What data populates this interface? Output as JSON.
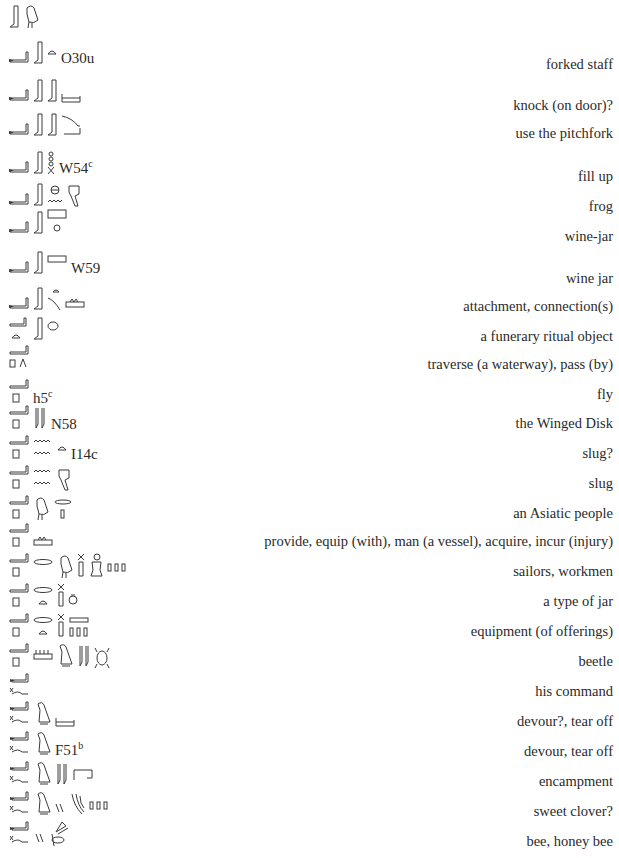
{
  "entries": [
    {
      "y": 2,
      "gloss": "",
      "gloss_y": 0,
      "glyphs": [
        "leg",
        "bird"
      ],
      "code": "",
      "sup": ""
    },
    {
      "y": 38,
      "gloss": "forked staff",
      "gloss_y": 56,
      "glyphs": [
        "arm",
        "leg",
        "bread"
      ],
      "code": "O30u",
      "sup": ""
    },
    {
      "y": 76,
      "gloss": "knock (on door)?",
      "gloss_y": 97,
      "glyphs": [
        "arm",
        "leg",
        "leg",
        "bolt"
      ],
      "code": "",
      "sup": ""
    },
    {
      "y": 110,
      "gloss": "use the pitchfork",
      "gloss_y": 125,
      "glyphs": [
        "arm",
        "leg",
        "leg",
        "pitchfork"
      ],
      "code": "",
      "sup": ""
    },
    {
      "y": 148,
      "gloss": "fill up",
      "gloss_y": 168,
      "glyphs": [
        "arm",
        "leg",
        "rope"
      ],
      "code": "W54",
      "sup": "c"
    },
    {
      "y": 180,
      "gloss": "frog",
      "gloss_y": 198,
      "glyphs": [
        "arm",
        "leg",
        "sieve-water",
        "frog-sign"
      ],
      "code": "",
      "sup": ""
    },
    {
      "y": 208,
      "gloss": "wine-jar",
      "gloss_y": 228,
      "glyphs": [
        "arm",
        "leg",
        "jar-stand"
      ],
      "code": "",
      "sup": ""
    },
    {
      "y": 248,
      "gloss": "wine jar",
      "gloss_y": 270,
      "glyphs": [
        "arm",
        "leg",
        "rect"
      ],
      "code": "W59",
      "sup": ""
    },
    {
      "y": 284,
      "gloss": "attachment, connection(s)",
      "gloss_y": 298,
      "glyphs": [
        "arm",
        "leg",
        "bread-rope",
        "basin"
      ],
      "code": "",
      "sup": ""
    },
    {
      "y": 314,
      "gloss": "a funerary ritual object",
      "gloss_y": 328,
      "glyphs": [
        "arm-bread",
        "leg",
        "oval"
      ],
      "code": "",
      "sup": ""
    },
    {
      "y": 344,
      "gloss": "traverse (a waterway), pass (by)",
      "gloss_y": 356,
      "glyphs": [
        "arm-square-legs"
      ],
      "code": "",
      "sup": ""
    },
    {
      "y": 378,
      "gloss": "fly",
      "gloss_y": 386,
      "glyphs": [
        "arm-square"
      ],
      "code": "h5",
      "sup": "c"
    },
    {
      "y": 404,
      "gloss": "the Winged Disk",
      "gloss_y": 415,
      "glyphs": [
        "arm-square",
        "reeds"
      ],
      "code": "N58",
      "sup": ""
    },
    {
      "y": 434,
      "gloss": "slug?",
      "gloss_y": 445,
      "glyphs": [
        "arm-square",
        "water2",
        "bread"
      ],
      "code": "I14c",
      "sup": ""
    },
    {
      "y": 464,
      "gloss": "slug",
      "gloss_y": 475,
      "glyphs": [
        "arm-square",
        "water2",
        "frog-sign"
      ],
      "code": "",
      "sup": ""
    },
    {
      "y": 494,
      "gloss": "an Asiatic people",
      "gloss_y": 505,
      "glyphs": [
        "arm-square",
        "bird",
        "mouth-stroke"
      ],
      "code": "",
      "sup": ""
    },
    {
      "y": 522,
      "gloss": "provide, equip (with), man (a vessel), acquire, incur (injury)",
      "gloss_y": 533,
      "glyphs": [
        "arm-square",
        "basin"
      ],
      "code": "",
      "sup": ""
    },
    {
      "y": 552,
      "gloss": "sailors, workmen",
      "gloss_y": 563,
      "glyphs": [
        "arm-square",
        "mouth",
        "bird",
        "jug",
        "man",
        "plural"
      ],
      "code": "",
      "sup": ""
    },
    {
      "y": 582,
      "gloss": "a type of jar",
      "gloss_y": 593,
      "glyphs": [
        "arm-square",
        "mouth-bread",
        "jug",
        "pot"
      ],
      "code": "",
      "sup": ""
    },
    {
      "y": 612,
      "gloss": "equipment (of offerings)",
      "gloss_y": 623,
      "glyphs": [
        "arm-square",
        "mouth-bread",
        "jug",
        "basin-plural"
      ],
      "code": "",
      "sup": ""
    },
    {
      "y": 642,
      "gloss": "beetle",
      "gloss_y": 653,
      "glyphs": [
        "arm-square",
        "reed-basin",
        "vulture",
        "reeds",
        "beetle"
      ],
      "code": "",
      "sup": ""
    },
    {
      "y": 672,
      "gloss": "his command",
      "gloss_y": 683,
      "glyphs": [
        "arm-snake"
      ],
      "code": "",
      "sup": ""
    },
    {
      "y": 700,
      "gloss": "devour?, tear off",
      "gloss_y": 713,
      "glyphs": [
        "arm-snake",
        "vulture",
        "bolt"
      ],
      "code": "",
      "sup": ""
    },
    {
      "y": 730,
      "gloss": "devour, tear off",
      "gloss_y": 743,
      "glyphs": [
        "arm-snake",
        "vulture"
      ],
      "code": "F51",
      "sup": "b"
    },
    {
      "y": 760,
      "gloss": "encampment",
      "gloss_y": 773,
      "glyphs": [
        "arm-snake",
        "vulture",
        "reeds",
        "enclosure"
      ],
      "code": "",
      "sup": ""
    },
    {
      "y": 790,
      "gloss": "sweet clover?",
      "gloss_y": 803,
      "glyphs": [
        "arm-snake",
        "vulture",
        "dual",
        "plant",
        "plural"
      ],
      "code": "",
      "sup": ""
    },
    {
      "y": 820,
      "gloss": "bee, honey bee",
      "gloss_y": 833,
      "glyphs": [
        "arm-snake",
        "dual",
        "bee"
      ],
      "code": "",
      "sup": ""
    }
  ]
}
